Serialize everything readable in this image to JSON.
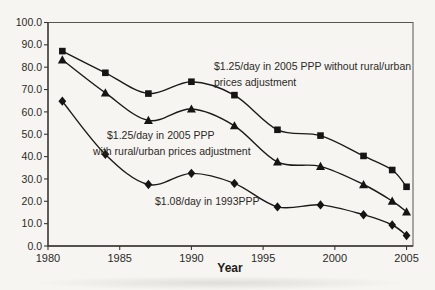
{
  "chart_data": {
    "type": "line",
    "title": "",
    "xlabel": "Year",
    "ylabel": "",
    "x": [
      1981,
      1984,
      1987,
      1990,
      1993,
      1996,
      1999,
      2002,
      2004,
      2005
    ],
    "xlim": [
      1980,
      2005.45
    ],
    "ylim": [
      0,
      100
    ],
    "xticks": [
      1980,
      1985,
      1990,
      1995,
      2000,
      2005
    ],
    "xtick_labels": [
      "1980",
      "1985",
      "1990",
      "1995",
      "2000",
      "2005"
    ],
    "yticks": [
      0,
      10,
      20,
      30,
      40,
      50,
      60,
      70,
      80,
      90,
      100
    ],
    "ytick_labels": [
      "0.0",
      "10.0",
      "20.0",
      "30.0",
      "40.0",
      "50.0",
      "60.0",
      "70.0",
      "80.0",
      "90.0",
      "100.0"
    ],
    "grid": "off",
    "legend_position": "inline-annotations",
    "series": [
      {
        "name": "$1.25/day in 2005 PPP without rural/urban prices adjustment",
        "marker": "square",
        "values": [
          87.2,
          77.5,
          68.2,
          73.5,
          67.5,
          52.0,
          49.4,
          40.3,
          34.0,
          26.5
        ]
      },
      {
        "name": "$1.25/day in 2005 PPP with rural/urban prices adjustment",
        "marker": "triangle",
        "values": [
          83.3,
          68.5,
          56.2,
          61.3,
          53.8,
          37.6,
          35.6,
          27.5,
          20.1,
          15.3
        ]
      },
      {
        "name": "$1.08/day in 1993PPP",
        "marker": "diamond",
        "values": [
          64.8,
          41.0,
          27.5,
          32.5,
          28.0,
          17.5,
          18.4,
          14.0,
          9.4,
          4.7
        ]
      }
    ],
    "annotations": [
      {
        "series": "without-adjustment",
        "lines": [
          {
            "text": "$1.25/day in 2005 PPP without rural/urban",
            "x": 214,
            "y": 70
          },
          {
            "text": "prices adjustment",
            "x": 214,
            "y": 86
          }
        ]
      },
      {
        "series": "with-adjustment",
        "lines": [
          {
            "text": "$1.25/day in 2005 PPP",
            "x": 107,
            "y": 139
          },
          {
            "text": "with rural/urban prices adjustment",
            "x": 93,
            "y": 154.5
          }
        ]
      },
      {
        "series": "1993ppp",
        "lines": [
          {
            "text": "$1.08/day in 1993PPP",
            "x": 155,
            "y": 205
          }
        ]
      }
    ],
    "colors": {
      "line": "#1c1a18",
      "marker": "#171513",
      "axis": "#3a3733",
      "frame": "#5a564f",
      "text": "#2c2a27",
      "background": "#f6f5f2"
    }
  }
}
